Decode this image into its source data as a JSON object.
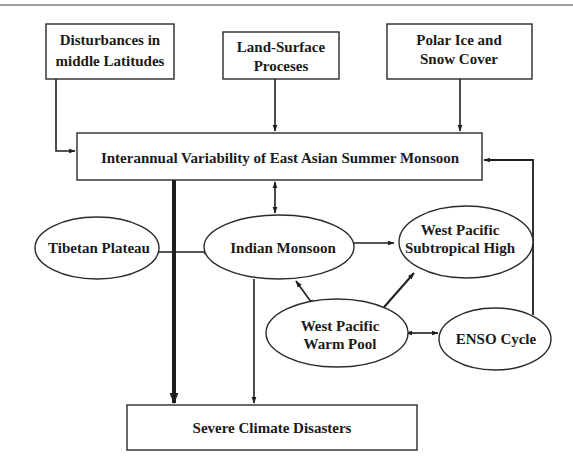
{
  "diagram": {
    "type": "flowchart",
    "colors": {
      "stroke": "#2a2a2a",
      "text": "#1a1a1a",
      "background": "#ffffff"
    },
    "nodes": {
      "disturbances": {
        "shape": "rect",
        "lines": [
          "Disturbances in",
          "middle Latitudes"
        ]
      },
      "land_surface": {
        "shape": "rect",
        "lines": [
          "Land-Surface",
          "Proceses"
        ]
      },
      "polar_ice": {
        "shape": "rect",
        "lines": [
          "Polar Ice and",
          "Snow Cover"
        ]
      },
      "interannual": {
        "shape": "rect",
        "lines": [
          "Interannual Variability of East Asian Summer Monsoon"
        ]
      },
      "tibetan": {
        "shape": "ellipse",
        "lines": [
          "Tibetan Plateau"
        ]
      },
      "indian": {
        "shape": "ellipse",
        "lines": [
          "Indian Monsoon"
        ]
      },
      "wp_high": {
        "shape": "ellipse",
        "lines": [
          "West Pacific",
          "Subtropical High"
        ]
      },
      "wp_warm": {
        "shape": "ellipse",
        "lines": [
          "West Pacific",
          "Warm Pool"
        ]
      },
      "enso": {
        "shape": "ellipse",
        "lines": [
          "ENSO Cycle"
        ]
      },
      "severe": {
        "shape": "rect",
        "lines": [
          "Severe Climate Disasters"
        ]
      }
    },
    "edges": [
      {
        "from": "Disturbances in middle Latitudes",
        "to": "Interannual Variability of East Asian Summer Monsoon",
        "direction": "one-way"
      },
      {
        "from": "Land-Surface Proceses",
        "to": "Interannual Variability of East Asian Summer Monsoon",
        "direction": "one-way"
      },
      {
        "from": "Polar Ice and Snow Cover",
        "to": "Interannual Variability of East Asian Summer Monsoon",
        "direction": "one-way"
      },
      {
        "from": "Interannual Variability of East Asian Summer Monsoon",
        "to": "Indian Monsoon",
        "direction": "two-way"
      },
      {
        "from": "Interannual Variability of East Asian Summer Monsoon",
        "to": "Severe Climate Disasters",
        "direction": "one-way",
        "weight": "thick"
      },
      {
        "from": "Tibetan Plateau",
        "to": "Indian Monsoon",
        "direction": "one-way"
      },
      {
        "from": "Indian Monsoon",
        "to": "West Pacific Subtropical High",
        "direction": "two-way"
      },
      {
        "from": "Indian Monsoon",
        "to": "West Pacific Warm Pool",
        "direction": "two-way"
      },
      {
        "from": "West Pacific Warm Pool",
        "to": "West Pacific Subtropical High",
        "direction": "one-way"
      },
      {
        "from": "West Pacific Warm Pool",
        "to": "ENSO Cycle",
        "direction": "two-way"
      },
      {
        "from": "ENSO Cycle",
        "to": "Interannual Variability of East Asian Summer Monsoon",
        "direction": "one-way"
      },
      {
        "from": "Indian Monsoon",
        "to": "Severe Climate Disasters",
        "direction": "one-way"
      }
    ]
  }
}
